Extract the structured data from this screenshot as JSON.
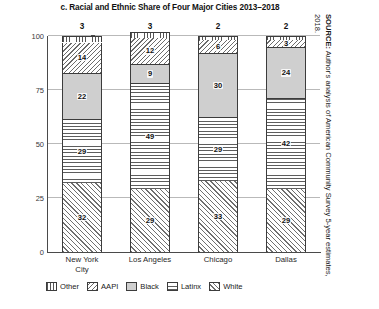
{
  "chart_data": {
    "type": "bar",
    "subtype": "stacked-bar-100",
    "title": "c. Racial and Ethnic Share of Four Major Cities 2013–2018",
    "xlabel": "",
    "ylabel": "Percent",
    "ylim": [
      0,
      100
    ],
    "yticks": [
      0,
      25,
      50,
      75,
      100
    ],
    "grid": true,
    "legend_position": "bottom",
    "categories": [
      "New York City",
      "Los Angeles",
      "Chicago",
      "Dallas"
    ],
    "category_lines": [
      [
        "New York",
        "City"
      ],
      [
        "Los Angeles"
      ],
      [
        "Chicago"
      ],
      [
        "Dallas"
      ]
    ],
    "series": [
      {
        "name": "White",
        "values": [
          32,
          29,
          33,
          29
        ]
      },
      {
        "name": "Latinx",
        "values": [
          29,
          49,
          29,
          42
        ]
      },
      {
        "name": "Black",
        "values": [
          22,
          9,
          30,
          24
        ]
      },
      {
        "name": "AAPI",
        "values": [
          14,
          12,
          6,
          3
        ]
      },
      {
        "name": "Other",
        "values": [
          3,
          3,
          2,
          2
        ]
      }
    ],
    "stack_order_bottom_to_top": [
      "White",
      "Latinx",
      "Black",
      "AAPI",
      "Other"
    ],
    "annotations": {
      "above_bar_values": [
        3,
        3,
        2,
        2
      ],
      "note": "Other values are printed above each bar"
    }
  },
  "legend": {
    "items": [
      {
        "label": "Other",
        "pattern": "vertical-lines"
      },
      {
        "label": "AAPI",
        "pattern": "diagonal-hatch-down"
      },
      {
        "label": "Black",
        "pattern": "solid-gray"
      },
      {
        "label": "Latinx",
        "pattern": "horizontal-lines"
      },
      {
        "label": "White",
        "pattern": "diagonal-hatch-up"
      }
    ]
  },
  "source": {
    "prefix": "SOURCE:",
    "text": " Author's analysis of American Community Survey 5-year estimates, 2018."
  },
  "colors": {
    "gray_fill": "#cfcfcf",
    "line": "#3c3c3c",
    "grid": "#b9b9b9"
  }
}
